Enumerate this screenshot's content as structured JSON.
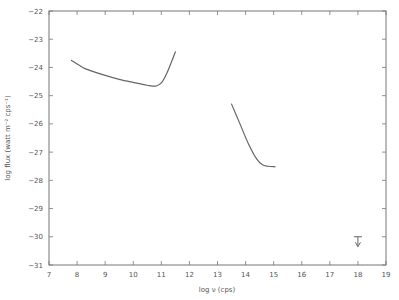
{
  "chart_data": {
    "type": "line",
    "title": "",
    "xlabel": "log ν (cps)",
    "ylabel": "log flux (watt m⁻² cps⁻¹)",
    "xlim": [
      7,
      19
    ],
    "ylim": [
      -31,
      -22
    ],
    "grid": false,
    "legend": null,
    "x_ticks": [
      7,
      8,
      9,
      10,
      11,
      12,
      13,
      14,
      15,
      16,
      17,
      18,
      19
    ],
    "y_ticks": [
      -22,
      -23,
      -24,
      -25,
      -26,
      -27,
      -28,
      -29,
      -30,
      -31
    ],
    "series": [
      {
        "name": "radio spectrum",
        "x": [
          7.8,
          8.2,
          8.5,
          9.0,
          9.5,
          10.0,
          10.5,
          10.8,
          11.0,
          11.2,
          11.5
        ],
        "y": [
          -23.75,
          -24.0,
          -24.12,
          -24.28,
          -24.42,
          -24.53,
          -24.63,
          -24.66,
          -24.55,
          -24.2,
          -23.45
        ]
      },
      {
        "name": "optical/infrared spectrum",
        "x": [
          13.5,
          13.8,
          14.1,
          14.4,
          14.6,
          14.8,
          15.05
        ],
        "y": [
          -25.3,
          -26.0,
          -26.7,
          -27.25,
          -27.45,
          -27.5,
          -27.52
        ]
      },
      {
        "name": "x-ray upper limit",
        "type": "upper_limit",
        "x": [
          18.0
        ],
        "y": [
          -30.0
        ]
      }
    ]
  }
}
